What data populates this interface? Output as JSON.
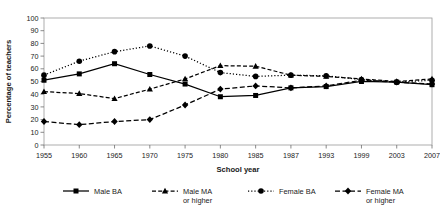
{
  "chart_data": {
    "type": "line",
    "title": "",
    "xlabel": "School year",
    "ylabel": "Percentage of teachers",
    "categories": [
      "1955",
      "1960",
      "1965",
      "1970",
      "1975",
      "1980",
      "1985",
      "1987",
      "1993",
      "1999",
      "2003",
      "2007"
    ],
    "ylim": [
      0,
      100
    ],
    "yticks": [
      0,
      10,
      20,
      30,
      40,
      50,
      60,
      70,
      80,
      90,
      100
    ],
    "grid": false,
    "legend_position": "bottom",
    "series": [
      {
        "name": "Male BA",
        "marker": "square",
        "line_style": "solid",
        "color": "#000000",
        "values": [
          51,
          56,
          64,
          55.5,
          48,
          38,
          39,
          45,
          46,
          50,
          49.5,
          47.5
        ]
      },
      {
        "name": "Male MA or higher",
        "marker": "triangle",
        "line_style": "dashed",
        "color": "#000000",
        "values": [
          42,
          40.5,
          36.5,
          44,
          52,
          62.5,
          62,
          55,
          54,
          52,
          50,
          52
        ]
      },
      {
        "name": "Female BA",
        "marker": "circle",
        "line_style": "dotted",
        "color": "#000000",
        "values": [
          55,
          66,
          73.5,
          78,
          70,
          57,
          54,
          55,
          54.5,
          51.5,
          49.5,
          51
        ]
      },
      {
        "name": "Female MA or higher",
        "marker": "diamond",
        "line_style": "dashdot",
        "color": "#000000",
        "values": [
          18.5,
          16,
          18.5,
          20,
          31.5,
          44,
          46.5,
          45,
          46.5,
          51,
          49.5,
          48
        ]
      }
    ]
  },
  "axes": {
    "ylabel": "Percentage of teachers",
    "xlabel": "School year"
  },
  "legend": {
    "entries": [
      {
        "label_line1": "Male BA",
        "label_line2": "",
        "icon": "square-marker-solid-line-icon"
      },
      {
        "label_line1": "Male MA",
        "label_line2": "or higher",
        "icon": "triangle-marker-dashed-line-icon"
      },
      {
        "label_line1": "Female BA",
        "label_line2": "",
        "icon": "circle-marker-dotted-line-icon"
      },
      {
        "label_line1": "Female MA",
        "label_line2": "or higher",
        "icon": "diamond-marker-dashdot-line-icon"
      }
    ]
  }
}
